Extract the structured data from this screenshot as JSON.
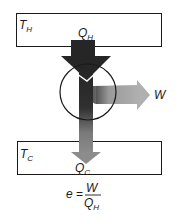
{
  "hot_reservoir": {
    "label": "T",
    "sub": "H"
  },
  "heat_in": {
    "label": "Q",
    "sub": "H"
  },
  "work_out": {
    "label": "W"
  },
  "cold_reservoir": {
    "label": "T",
    "sub": "C"
  },
  "heat_out": {
    "label": "Q",
    "sub": "C"
  },
  "efficiency": {
    "lhs": "e",
    "equals": "=",
    "numerator": "W",
    "denominator": "Q",
    "denominator_sub": "H"
  },
  "colors": {
    "box_stroke": "#1a1a1a",
    "arrow_in": "#2a2a2a",
    "arrow_work": "#a8a8a8",
    "arrow_cold": "#8c8c8c",
    "engine_circle": "#1a1a1a"
  }
}
